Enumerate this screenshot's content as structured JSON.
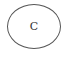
{
  "diagram": {
    "nodes": [
      {
        "id": "C",
        "shape": "ellipse",
        "label": "C",
        "stroke": "#555555",
        "fill": "#ffffff"
      }
    ],
    "edges": []
  }
}
